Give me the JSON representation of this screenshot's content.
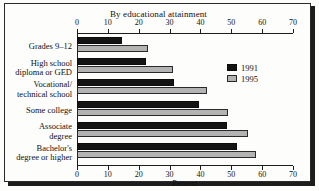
{
  "chart_data": {
    "type": "bar",
    "orientation": "horizontal",
    "title": "",
    "subtitle": "By educational attainment",
    "xlabel": "Percent",
    "ylabel": "",
    "xlim": [
      0,
      70
    ],
    "xticks": [
      0,
      10,
      20,
      30,
      40,
      50,
      60,
      70
    ],
    "grid": false,
    "legend_position": "right",
    "categories": [
      "Grades 9–12",
      "High school diploma or GED",
      "Vocational/ technical school",
      "Some college",
      "Associate degree",
      "Bachelor's degree or higher"
    ],
    "category_lines": [
      [
        "Grades 9–12"
      ],
      [
        "High school",
        "diploma or GED"
      ],
      [
        "Vocational/",
        "technical school"
      ],
      [
        "Some college"
      ],
      [
        "Associate",
        "degree"
      ],
      [
        "Bachelor's",
        "degree or higher"
      ]
    ],
    "series": [
      {
        "name": "1991",
        "color": "#141414",
        "values": [
          14.5,
          22.5,
          31.5,
          39.5,
          48.5,
          52.0
        ]
      },
      {
        "name": "1995",
        "color": "#b3b3b3",
        "values": [
          23.0,
          31.0,
          42.0,
          49.0,
          55.5,
          58.0
        ]
      }
    ]
  },
  "axis": {
    "top_ticks": [
      "0",
      "10",
      "20",
      "30",
      "40",
      "50",
      "60",
      "70"
    ],
    "bottom_ticks": [
      "0",
      "10",
      "20",
      "30",
      "40",
      "50",
      "60",
      "70"
    ],
    "xlabel": "Percent"
  },
  "legend": {
    "items": [
      {
        "label": "1991",
        "swatch": "black-swatch"
      },
      {
        "label": "1995",
        "swatch": "gray-swatch"
      }
    ]
  },
  "subtitle": "By educational attainment"
}
